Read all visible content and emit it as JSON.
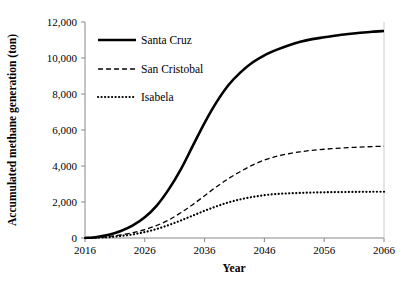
{
  "chart_data": {
    "type": "line",
    "title": "",
    "xlabel": "Year",
    "ylabel": "Accumulated methane generation (ton)",
    "xlim": [
      2016,
      2066
    ],
    "ylim": [
      0,
      12000
    ],
    "grid": false,
    "legend_position": "upper-left-inside",
    "x_ticks": [
      "2016",
      "2026",
      "2036",
      "2046",
      "2056",
      "2066"
    ],
    "x_tick_values": [
      2016,
      2026,
      2036,
      2046,
      2056,
      2066
    ],
    "y_ticks": [
      "0",
      "2,000",
      "4,000",
      "6,000",
      "8,000",
      "10,000",
      "12,000"
    ],
    "y_tick_values": [
      0,
      2000,
      4000,
      6000,
      8000,
      10000,
      12000
    ],
    "x": [
      2016,
      2018,
      2020,
      2022,
      2024,
      2026,
      2028,
      2030,
      2032,
      2034,
      2036,
      2038,
      2040,
      2042,
      2044,
      2046,
      2048,
      2050,
      2052,
      2054,
      2056,
      2058,
      2060,
      2062,
      2064,
      2066
    ],
    "series": [
      {
        "name": "Santa Cruz",
        "style": "solid",
        "color": "#000000",
        "width": 2.6,
        "values": [
          0,
          60,
          180,
          390,
          700,
          1150,
          1800,
          2700,
          3800,
          5100,
          6400,
          7550,
          8500,
          9200,
          9750,
          10150,
          10450,
          10700,
          10900,
          11050,
          11150,
          11250,
          11330,
          11400,
          11460,
          11500
        ]
      },
      {
        "name": "San Cristobal",
        "style": "dashed",
        "color": "#000000",
        "width": 1.3,
        "values": [
          0,
          25,
          80,
          170,
          300,
          470,
          700,
          1000,
          1400,
          1850,
          2350,
          2850,
          3300,
          3700,
          4050,
          4330,
          4530,
          4680,
          4790,
          4870,
          4930,
          4980,
          5020,
          5050,
          5080,
          5100
        ]
      },
      {
        "name": "Isabela",
        "style": "dotted",
        "color": "#000000",
        "width": 2.2,
        "values": [
          0,
          15,
          50,
          110,
          200,
          330,
          500,
          720,
          970,
          1240,
          1510,
          1760,
          1980,
          2150,
          2280,
          2380,
          2440,
          2480,
          2505,
          2525,
          2540,
          2550,
          2558,
          2563,
          2568,
          2570
        ]
      }
    ]
  },
  "legend": {
    "items": [
      {
        "label": "Santa Cruz"
      },
      {
        "label": "San Cristobal"
      },
      {
        "label": "Isabela"
      }
    ]
  }
}
